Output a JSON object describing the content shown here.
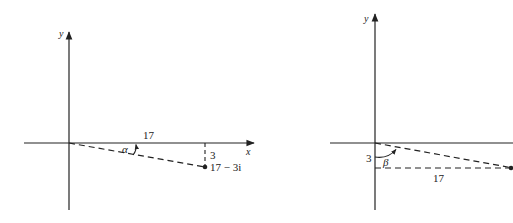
{
  "figure_left": {
    "x_axis_label": "x",
    "y_axis_label": "y",
    "real_part_label": "17",
    "imag_part_label": "3",
    "angle_label": "α",
    "point_label": "17 − 3i"
  },
  "figure_right": {
    "y_axis_label": "y",
    "vertical_label": "3",
    "horizontal_label": "17",
    "angle_label": "β"
  },
  "colors": {
    "ink": "#222222",
    "background": "#ffffff"
  }
}
